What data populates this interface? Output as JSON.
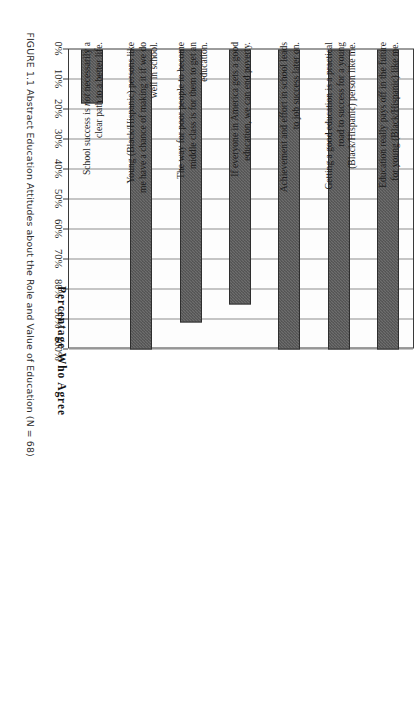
{
  "figure": {
    "caption_label": "FIGURE 1.1",
    "caption_text": "Abstract Education Attitudes about the Role and Value of Education (N = 68)",
    "caption_full": "FIGURE 1.1 Abstract Education Attitudes about the Role and Value of Education (N = 68)"
  },
  "chart_data": {
    "type": "bar",
    "orientation": "horizontal",
    "title": "",
    "xlabel": "Percentage Who Agree",
    "ylabel": "",
    "xlim": [
      0,
      100
    ],
    "grid": true,
    "legend": "none",
    "tick_labels": [
      "0%",
      "10%",
      "20%",
      "30%",
      "40%",
      "50%",
      "60%",
      "70%",
      "80%",
      "90%",
      "100%"
    ],
    "tick_values": [
      0,
      10,
      20,
      30,
      40,
      50,
      60,
      70,
      80,
      90,
      100
    ],
    "categories": [
      "Education really pays off in the future for young (Black/Hispanic) like me.",
      "Getting a good education is a practical road to success for a young (Black/Hispanic) person like me.",
      "Achievement and effort in school leads to job success later on.",
      "If everyone in America gets a good education, we can end poverty.",
      "The way for poor people to become middle class is for them to get an education.",
      "Young (Black/Hispanic) persons like me have a chance of making it if we do well in school.",
      "School success is not necessarily a clear path to a better life."
    ],
    "values": [
      100,
      100,
      100,
      85,
      91,
      100,
      18
    ],
    "bar_color": "#5a5a5a",
    "bar_edge_color": "#2e2e2e",
    "grid_color": "#8e8e8e",
    "frame_color": "#3a3a3a",
    "background": "#ffffff"
  }
}
